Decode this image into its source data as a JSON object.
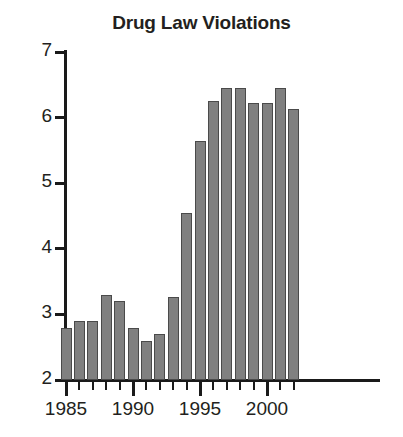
{
  "chart_data": {
    "type": "bar",
    "title": "Drug Law Violations",
    "xlabel": "",
    "ylabel": "",
    "ylim": [
      2,
      7
    ],
    "xlim": [
      1984.4,
      2002.6
    ],
    "grid": false,
    "legend": false,
    "yticks": [
      2,
      3,
      4,
      5,
      6,
      7
    ],
    "ytick_labels": [
      "2",
      "3",
      "4",
      "5",
      "6",
      "7"
    ],
    "xticks": [
      1985,
      1990,
      1995,
      2000
    ],
    "xtick_labels": [
      "1985",
      "1990",
      "1995",
      "2000"
    ],
    "minor_xticks": [
      1985,
      1986,
      1987,
      1988,
      1989,
      1990,
      1991,
      1992,
      1993,
      1994,
      1995,
      1996,
      1997,
      1998,
      1999,
      2000,
      2001,
      2002
    ],
    "categories": [
      1985,
      1986,
      1987,
      1988,
      1989,
      1990,
      1991,
      1992,
      1993,
      1994,
      1995,
      1996,
      1997,
      1998,
      1999,
      2000,
      2001,
      2002
    ],
    "values": [
      2.8,
      2.9,
      2.9,
      3.3,
      3.2,
      2.8,
      2.6,
      2.7,
      3.27,
      4.55,
      5.65,
      6.25,
      6.45,
      6.45,
      6.22,
      6.22,
      6.45,
      6.13
    ],
    "bar_color": "#808080",
    "bar_edge_color": "#4a4a4a",
    "axis_color": "#1a1a1a",
    "text_color": "#231f20",
    "background_color": "#ffffff"
  }
}
